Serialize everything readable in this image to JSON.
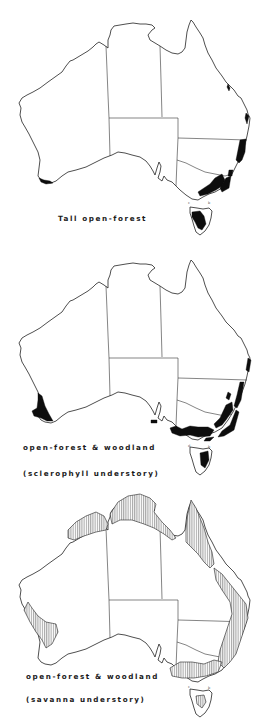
{
  "figure": {
    "panels": [
      {
        "id": "tall-open-forest",
        "caption_lines": [
          "Tall open-forest"
        ],
        "fill_style": "solid-black"
      },
      {
        "id": "open-forest-woodland-sclerophyll",
        "caption_lines": [
          "open-forest & woodland",
          "(sclerophyll understory)"
        ],
        "fill_style": "solid-black"
      },
      {
        "id": "open-forest-woodland-savanna",
        "caption_lines": [
          "open-forest & woodland",
          "(savanna understory)"
        ],
        "fill_style": "vertical-hatching"
      }
    ],
    "colors": {
      "background": "#ffffff",
      "outline": "#222222",
      "fill": "#0d0d0d"
    }
  }
}
